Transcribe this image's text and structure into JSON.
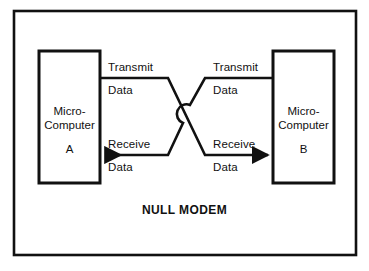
{
  "figure": {
    "title": "NULL MODEM",
    "background_color": "#ffffff",
    "line_color": "#111111"
  },
  "outer_frame": {
    "name": "figure-border"
  },
  "devices": [
    {
      "id": "device-a",
      "line1": "Micro-",
      "line2": "Computer",
      "designator": "A"
    },
    {
      "id": "device-b",
      "line1": "Micro-",
      "line2": "Computer",
      "designator": "B"
    }
  ],
  "signals": {
    "a_transmit": {
      "line1": "Transmit",
      "line2": "Data"
    },
    "b_transmit": {
      "line1": "Transmit",
      "line2": "Data"
    },
    "a_receive": {
      "line1": "Receive",
      "line2": "Data"
    },
    "b_receive": {
      "line1": "Receive",
      "line2": "Data"
    }
  },
  "caption_fragment": ""
}
